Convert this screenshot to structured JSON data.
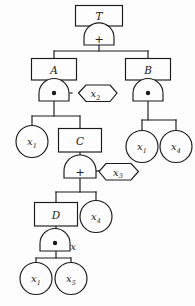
{
  "diagram": {
    "stroke_color": "#1a1a1a",
    "background_color": "#fdfdfd",
    "gate_symbols": {
      "or": "+",
      "and": "•"
    },
    "nodes": {
      "top_event": {
        "label": "T",
        "type": "box"
      },
      "gate_top": {
        "label": "+",
        "type": "or-gate"
      },
      "box_a": {
        "label": "A",
        "type": "box"
      },
      "box_b": {
        "label": "B",
        "type": "box"
      },
      "gate_a": {
        "label": "•",
        "type": "and-gate"
      },
      "gate_b": {
        "label": "•",
        "type": "and-gate"
      },
      "cond_x2": {
        "label": "x",
        "subscript": "2",
        "type": "hexagon"
      },
      "leaf_a_x1": {
        "label": "x",
        "subscript": "1",
        "type": "circle"
      },
      "box_c": {
        "label": "C",
        "type": "box"
      },
      "leaf_b_x1": {
        "label": "x",
        "subscript": "1",
        "type": "circle"
      },
      "leaf_b_x4": {
        "label": "x",
        "subscript": "4",
        "type": "circle"
      },
      "gate_c": {
        "label": "+",
        "type": "or-gate"
      },
      "cond_x3": {
        "label": "x",
        "subscript": "3",
        "type": "hexagon"
      },
      "box_d": {
        "label": "D",
        "type": "box"
      },
      "leaf_c_x4": {
        "label": "x",
        "subscript": "4",
        "type": "circle"
      },
      "gate_d": {
        "label": "•",
        "type": "and-gate"
      },
      "gate_d_side_label": {
        "label": "x",
        "type": "text"
      },
      "leaf_d_x1": {
        "label": "x",
        "subscript": "1",
        "type": "circle"
      },
      "leaf_d_x5": {
        "label": "x",
        "subscript": "5",
        "type": "circle"
      }
    }
  }
}
